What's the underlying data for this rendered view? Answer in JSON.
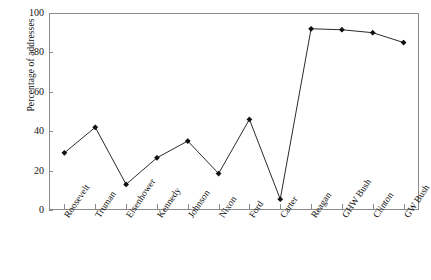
{
  "chart_data": {
    "type": "line",
    "title": "",
    "xlabel": "",
    "ylabel": "Percentage of addresses",
    "ylim": [
      0,
      100
    ],
    "yticks": [
      0,
      20,
      40,
      60,
      80,
      100
    ],
    "grid": false,
    "legend": "none",
    "marker": "filled-diamond",
    "line_color": "#2b2b2b",
    "marker_color": "#111111",
    "axis_color": "#8a8a8a",
    "background_color": "#ffffff",
    "categories": [
      "Roosevelt",
      "Truman",
      "Eisenhower",
      "Kennedy",
      "Johnson",
      "Nixon",
      "Ford",
      "Carter",
      "Reagan",
      "GHW Bush",
      "Clinton",
      "GW Bush"
    ],
    "values": [
      29,
      42,
      13,
      26.5,
      35,
      18.5,
      46,
      5.5,
      92,
      91.5,
      90,
      85
    ]
  }
}
